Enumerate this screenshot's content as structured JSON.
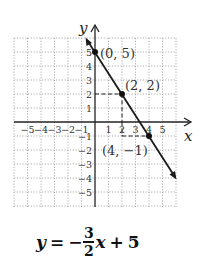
{
  "graph": {
    "x_axis_label": "x",
    "y_axis_label": "y",
    "x_range": [
      -6,
      6
    ],
    "y_range": [
      -6,
      6
    ],
    "x_tick_labels": [
      "−5",
      "−4",
      "−3",
      "−2",
      "−1",
      "1",
      "2",
      "3",
      "4",
      "5"
    ],
    "y_tick_labels": [
      "5",
      "4",
      "3",
      "2",
      "1",
      "−1",
      "−2",
      "−3",
      "−4",
      "−5"
    ],
    "points": [
      {
        "label": "(0, 5)",
        "x": 0,
        "y": 5
      },
      {
        "label": "(2, 2)",
        "x": 2,
        "y": 2
      },
      {
        "label": "(4, −1)",
        "x": 4,
        "y": -1
      }
    ],
    "line_color": "#1a1a1a",
    "grid_color": "#9a9a9a"
  },
  "equation": {
    "lhs": "y",
    "equals": "=",
    "sign": "−",
    "numerator": "3",
    "denominator": "2",
    "variable": "x",
    "plus": "+",
    "constant": "5"
  }
}
